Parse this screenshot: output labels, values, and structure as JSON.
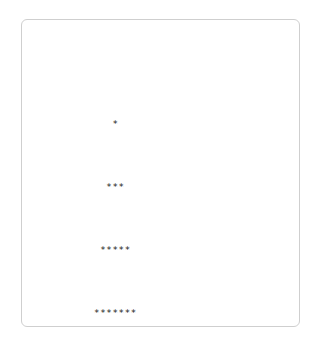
{
  "window": {
    "background_color": "#ffffff"
  },
  "output_panel": {
    "name": "ascii-output-panel",
    "border_color": "#cfcfcf",
    "background_color": "#ffffff"
  },
  "ascii_art": {
    "character": "*",
    "text_color": "#1a1a1a",
    "row_count": 14,
    "alignment": "centered",
    "pattern": "pyramid",
    "rows": [
      {
        "count": 1,
        "text": "*"
      },
      {
        "count": 3,
        "text": "***"
      },
      {
        "count": 5,
        "text": "*****"
      },
      {
        "count": 7,
        "text": "*******"
      },
      {
        "count": 9,
        "text": "*********"
      },
      {
        "count": 11,
        "text": "***********"
      },
      {
        "count": 13,
        "text": "*************"
      },
      {
        "count": 15,
        "text": "***************"
      },
      {
        "count": 17,
        "text": "*****************"
      },
      {
        "count": 19,
        "text": "*******************"
      },
      {
        "count": 21,
        "text": "*********************"
      },
      {
        "count": 23,
        "text": "***********************"
      },
      {
        "count": 25,
        "text": "*************************"
      },
      {
        "count": 27,
        "text": "***************************"
      }
    ]
  }
}
